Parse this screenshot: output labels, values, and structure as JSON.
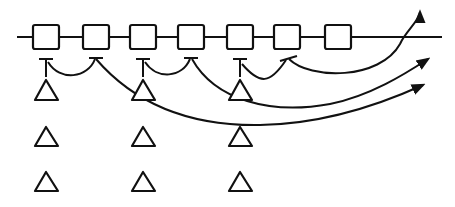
{
  "diagram": {
    "type": "line-diagram",
    "colors": {
      "stroke": "#111111",
      "background": "#ffffff"
    },
    "baseline": {
      "x1": 17,
      "x2": 442,
      "y": 37
    },
    "boxes": [
      {
        "id": "box-1",
        "cx": 46
      },
      {
        "id": "box-2",
        "cx": 96
      },
      {
        "id": "box-3",
        "cx": 143
      },
      {
        "id": "box-4",
        "cx": 191
      },
      {
        "id": "box-5",
        "cx": 240
      },
      {
        "id": "box-6",
        "cx": 287
      },
      {
        "id": "box-7",
        "cx": 338
      }
    ],
    "box_size": {
      "w": 26,
      "h": 24,
      "top": 25
    },
    "triangle_columns": [
      46,
      143,
      240
    ],
    "triangle_rows": [
      80,
      125,
      170
    ],
    "triangle_size": {
      "w": 24,
      "h": 20
    },
    "connections": [
      {
        "id": "arc-2-to-1",
        "from": "box-2",
        "to": "box-1",
        "shape": "short-arc"
      },
      {
        "id": "arc-4-to-3",
        "from": "box-4",
        "to": "box-3",
        "shape": "short-arc"
      },
      {
        "id": "arc-6-to-5",
        "from": "box-6",
        "to": "box-5",
        "shape": "short-arc"
      },
      {
        "id": "arc-6-to-exit-up",
        "from": "box-6",
        "to": "exit-top-right",
        "shape": "arrow-up"
      },
      {
        "id": "arc-4-to-exit",
        "from": "box-4",
        "to": "exit-right-upper",
        "shape": "long-arrow"
      },
      {
        "id": "arc-2-to-exit",
        "from": "box-2",
        "to": "exit-right-lower",
        "shape": "long-arrow"
      }
    ]
  }
}
